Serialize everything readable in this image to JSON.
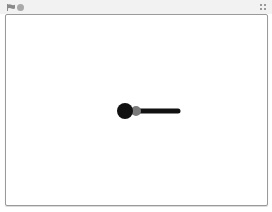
{
  "toolbar": {
    "green_flag_icon": "green-flag-icon",
    "stop_icon": "stop-icon",
    "fullscreen_icon": "fullscreen-icon"
  },
  "stage": {
    "background": "#ffffff",
    "sprite": {
      "body_color": "#111111",
      "joint_color": "#7a7a7a",
      "arm_color": "#111111"
    }
  }
}
